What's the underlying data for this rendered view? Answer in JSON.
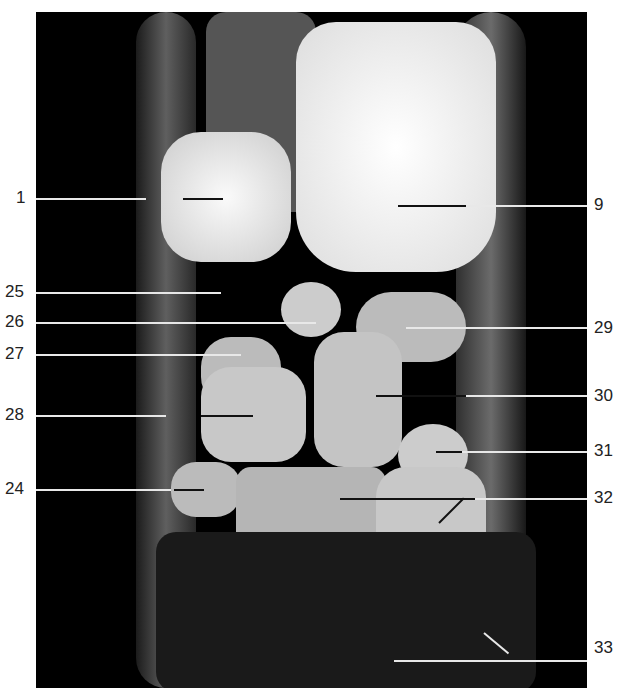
{
  "figure": {
    "type": "MRI coronal section of wrist",
    "background": "#000000",
    "labels_left": [
      {
        "text": "1",
        "y": 198
      },
      {
        "text": "25",
        "y": 292
      },
      {
        "text": "26",
        "y": 322
      },
      {
        "text": "27",
        "y": 354
      },
      {
        "text": "28",
        "y": 415
      },
      {
        "text": "24",
        "y": 489
      }
    ],
    "labels_right": [
      {
        "text": "9",
        "y": 205
      },
      {
        "text": "29",
        "y": 328
      },
      {
        "text": "30",
        "y": 396
      },
      {
        "text": "31",
        "y": 451
      },
      {
        "text": "32",
        "y": 498
      },
      {
        "text": "33",
        "y": 648
      }
    ]
  }
}
